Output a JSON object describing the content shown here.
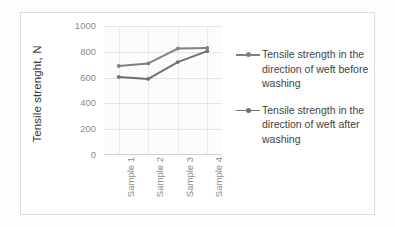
{
  "chart_data": {
    "type": "line",
    "title": "",
    "xlabel": "",
    "ylabel": "Tensile strenght, N",
    "categories": [
      "Sample 1",
      "Sample 2",
      "Sample 3",
      "Sample 4"
    ],
    "ylim": [
      0,
      1000
    ],
    "yticks": [
      0,
      200,
      400,
      600,
      800,
      1000
    ],
    "ytick_labels": [
      "0",
      "200",
      "400",
      "600",
      "800",
      "1000"
    ],
    "grid": true,
    "legend_position": "right",
    "series": [
      {
        "name": "Tensile strength in the direction of weft before washing",
        "color": "#808080",
        "values": [
          690,
          710,
          825,
          830
        ]
      },
      {
        "name": "Tensile strength in the direction of weft after washing",
        "color": "#707070",
        "values": [
          605,
          590,
          720,
          805
        ]
      }
    ]
  },
  "axis": {
    "y_title": "Tensile strenght, N"
  },
  "legend": {
    "items": [
      {
        "label": "Tensile strength in the direction of weft before washing",
        "color": "#808080"
      },
      {
        "label": "Tensile strength in the direction of weft after washing",
        "color": "#707070"
      }
    ]
  }
}
